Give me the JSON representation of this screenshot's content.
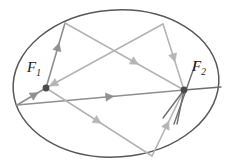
{
  "figure": {
    "type": "geometry-diagram",
    "canvas": {
      "width": 232,
      "height": 166
    },
    "background_color": "#ffffff",
    "ellipse": {
      "name": "ellipse-outline",
      "center_x": 116,
      "center_y": 83.5,
      "radius_x": 103,
      "radius_y": 73.5,
      "rotation_deg": -4,
      "stroke_color": "#585858",
      "stroke_width": 1.5,
      "fill": "none"
    },
    "foci": [
      {
        "id": "f1",
        "label": "F",
        "subscript": "1",
        "x": 46,
        "y": 88,
        "dot_radius": 3.4,
        "dot_color": "#4b4b4b",
        "label_x": 27,
        "label_y": 60
      },
      {
        "id": "f2",
        "label": "F",
        "subscript": "2",
        "x": 184,
        "y": 90,
        "dot_radius": 3.4,
        "dot_color": "#4b4b4b",
        "label_x": 192,
        "label_y": 59
      }
    ],
    "vertices": [
      {
        "id": "v-top-left",
        "x": 65,
        "y": 23
      },
      {
        "id": "v-top-right",
        "x": 163,
        "y": 24
      },
      {
        "id": "v-left",
        "x": 17,
        "y": 105
      },
      {
        "id": "v-bottom",
        "x": 152,
        "y": 156
      }
    ],
    "ray_color_dark": "#8f8f8f",
    "ray_color_light": "#b4b4b4",
    "ray_width": 1.6,
    "rays": [
      {
        "id": "ray-f1-to-topleft",
        "from": "f1",
        "to": "v-top-left",
        "x1": 46,
        "y1": 88,
        "x2": 65,
        "y2": 23,
        "tone": "dark",
        "arrow_t": 0.62,
        "arrow_size": 8
      },
      {
        "id": "ray-topleft-to-f2",
        "from": "v-top-left",
        "to": "f2",
        "x1": 65,
        "y1": 23,
        "x2": 184,
        "y2": 90,
        "tone": "light",
        "arrow_t": 0.58,
        "arrow_size": 8
      },
      {
        "id": "ray-f2-to-topright",
        "from": "f2",
        "to": "v-top-right",
        "x1": 184,
        "y1": 90,
        "x2": 163,
        "y2": 24,
        "tone": "light",
        "arrow_t": 0.5,
        "arrow_size": 8,
        "reverse": true
      },
      {
        "id": "ray-topright-to-f1",
        "from": "v-top-right",
        "to": "f1",
        "x1": 163,
        "y1": 24,
        "x2": 46,
        "y2": 88,
        "tone": "light",
        "arrow_t": 0.93,
        "arrow_size": 8
      },
      {
        "id": "ray-f1-to-left",
        "from": "f1",
        "to": "v-left",
        "x1": 46,
        "y1": 88,
        "x2": 17,
        "y2": 105,
        "tone": "dark",
        "arrow_t": 0.42,
        "arrow_size": 8,
        "reverse": true
      },
      {
        "id": "ray-left-to-f2",
        "from": "v-left",
        "to": "f2",
        "x1": 17,
        "y1": 105,
        "x2": 184,
        "y2": 90,
        "tone": "dark",
        "arrow_t": 0.55,
        "arrow_size": 8
      },
      {
        "id": "ray-f1-to-bottom",
        "from": "f1",
        "to": "v-bottom",
        "x1": 46,
        "y1": 88,
        "x2": 152,
        "y2": 156,
        "tone": "light",
        "arrow_t": 0.48,
        "arrow_size": 8
      },
      {
        "id": "ray-bottom-to-f2",
        "from": "v-bottom",
        "to": "f2",
        "x1": 152,
        "y1": 156,
        "x2": 184,
        "y2": 90,
        "tone": "light",
        "arrow_t": 0.46,
        "arrow_size": 8
      }
    ],
    "tangent_lines": [
      {
        "id": "tangent-at-f2-right",
        "x1": 184,
        "y1": 90,
        "x2": 221,
        "y2": 87,
        "tone": "dark"
      },
      {
        "id": "spoke-f2-lower-left",
        "x1": 184,
        "y1": 90,
        "x2": 163,
        "y2": 118,
        "tone": "dark"
      },
      {
        "id": "spoke-f2-down",
        "x1": 184,
        "y1": 90,
        "x2": 177,
        "y2": 124,
        "tone": "dark"
      },
      {
        "id": "normal-at-f2",
        "x1": 196,
        "y1": 62,
        "x2": 174,
        "y2": 124,
        "tone": "dark"
      }
    ]
  }
}
